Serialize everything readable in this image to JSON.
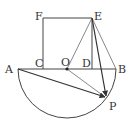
{
  "diagram": {
    "type": "geometry",
    "colors": {
      "stroke": "#444444",
      "label": "#333333",
      "background": "#ffffff"
    },
    "points": {
      "A": {
        "label": "A",
        "x": 18,
        "y": 69
      },
      "B": {
        "label": "B",
        "x": 116,
        "y": 69
      },
      "C": {
        "label": "C",
        "x": 43,
        "y": 69
      },
      "D": {
        "label": "D",
        "x": 92,
        "y": 69
      },
      "O": {
        "label": "O",
        "x": 67,
        "y": 69
      },
      "E": {
        "label": "E",
        "x": 92,
        "y": 18
      },
      "F": {
        "label": "F",
        "x": 43,
        "y": 18
      },
      "P": {
        "label": "P",
        "x": 106,
        "y": 98
      }
    },
    "segments": [
      "AB",
      "CF",
      "FE",
      "ED",
      "OE",
      "EB",
      "OP"
    ],
    "vectors": [
      "AP",
      "EP"
    ],
    "arcs": [
      {
        "name": "semicircle",
        "center": "O",
        "radius": 49,
        "side": "below AB"
      }
    ]
  }
}
